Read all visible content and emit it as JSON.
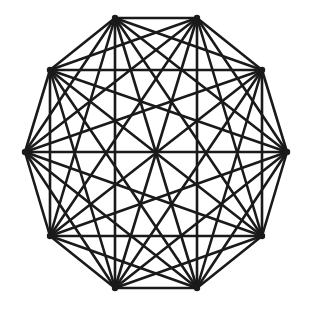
{
  "figure": {
    "kind": "graph-diagram",
    "width": 309,
    "height": 311,
    "background_color": "#ffffff",
    "stroke_color": "#1a1a1a",
    "stroke_width": 2.6,
    "vertex_dot_radius": 3.2,
    "vertex_count": 10,
    "edge_count": 45
  },
  "chart_data": {
    "type": "diagram",
    "graph_name": "K10",
    "vertex_count": 10,
    "edge_count": 45,
    "degree_per_vertex": 9,
    "polygon": "regular decagon",
    "center": [
      156,
      153
    ],
    "radius": 136,
    "rotation_degrees": 18,
    "title": "",
    "xlabel": "",
    "ylabel": "",
    "grid": false,
    "legend": false,
    "vertices": [
      {
        "id": 0,
        "label": "v0",
        "x": 115,
        "y": 18
      },
      {
        "id": 1,
        "label": "v1",
        "x": 197,
        "y": 18
      },
      {
        "id": 2,
        "label": "v2",
        "x": 262,
        "y": 70
      },
      {
        "id": 3,
        "label": "v3",
        "x": 287,
        "y": 152
      },
      {
        "id": 4,
        "label": "v4",
        "x": 262,
        "y": 236
      },
      {
        "id": 5,
        "label": "v5",
        "x": 197,
        "y": 288
      },
      {
        "id": 6,
        "label": "v6",
        "x": 115,
        "y": 288
      },
      {
        "id": 7,
        "label": "v7",
        "x": 50,
        "y": 236
      },
      {
        "id": 8,
        "label": "v8",
        "x": 25,
        "y": 152
      },
      {
        "id": 9,
        "label": "v9",
        "x": 50,
        "y": 70
      }
    ],
    "edges": [
      [
        0,
        1
      ],
      [
        0,
        2
      ],
      [
        0,
        3
      ],
      [
        0,
        4
      ],
      [
        0,
        5
      ],
      [
        0,
        6
      ],
      [
        0,
        7
      ],
      [
        0,
        8
      ],
      [
        0,
        9
      ],
      [
        1,
        2
      ],
      [
        1,
        3
      ],
      [
        1,
        4
      ],
      [
        1,
        5
      ],
      [
        1,
        6
      ],
      [
        1,
        7
      ],
      [
        1,
        8
      ],
      [
        1,
        9
      ],
      [
        2,
        3
      ],
      [
        2,
        4
      ],
      [
        2,
        5
      ],
      [
        2,
        6
      ],
      [
        2,
        7
      ],
      [
        2,
        8
      ],
      [
        2,
        9
      ],
      [
        3,
        4
      ],
      [
        3,
        5
      ],
      [
        3,
        6
      ],
      [
        3,
        7
      ],
      [
        3,
        8
      ],
      [
        3,
        9
      ],
      [
        4,
        5
      ],
      [
        4,
        6
      ],
      [
        4,
        7
      ],
      [
        4,
        8
      ],
      [
        4,
        9
      ],
      [
        5,
        6
      ],
      [
        5,
        7
      ],
      [
        5,
        8
      ],
      [
        5,
        9
      ],
      [
        6,
        7
      ],
      [
        6,
        8
      ],
      [
        6,
        9
      ],
      [
        7,
        8
      ],
      [
        7,
        9
      ],
      [
        8,
        9
      ]
    ]
  }
}
